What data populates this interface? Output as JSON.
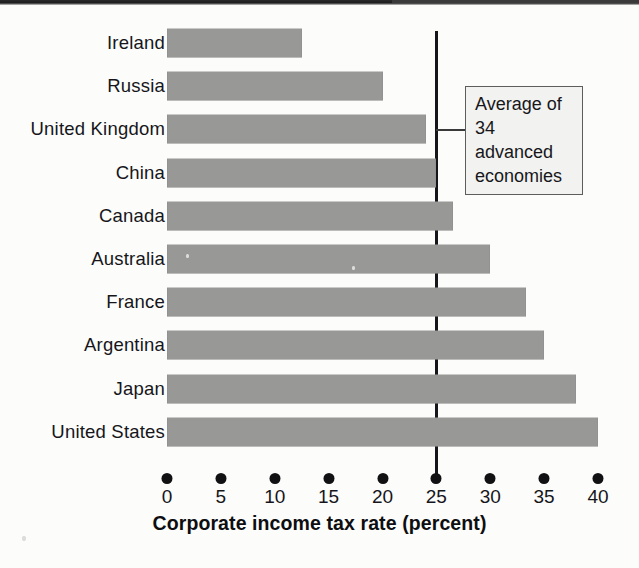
{
  "chart_data": {
    "type": "bar",
    "orientation": "horizontal",
    "title": "",
    "xlabel": "Corporate income tax rate (percent)",
    "ylabel": "",
    "categories": [
      "Ireland",
      "Russia",
      "United Kingdom",
      "China",
      "Canada",
      "Australia",
      "France",
      "Argentina",
      "Japan",
      "United States"
    ],
    "values": [
      12.5,
      20.0,
      24.0,
      25.0,
      26.5,
      30.0,
      33.3,
      35.0,
      38.0,
      40.0
    ],
    "xlim": [
      0,
      40
    ],
    "xticks": [
      0,
      5,
      10,
      15,
      20,
      25,
      30,
      35,
      40
    ],
    "xtick_labels": [
      "0",
      "5",
      "10",
      "15",
      "20",
      "25",
      "30",
      "35",
      "40"
    ],
    "grid": false,
    "legend": false,
    "bar_color": "#989897",
    "reference_line": {
      "value": 25,
      "color": "#16161a",
      "label": "Average of\n34 advanced\neconomies"
    },
    "annotations": [
      {
        "text": "Average of\n34 advanced\neconomies",
        "points_to": 25
      }
    ]
  },
  "axis": {
    "title": "Corporate income tax rate (percent)",
    "tick_labels": [
      "0",
      "5",
      "10",
      "15",
      "20",
      "25",
      "30",
      "35",
      "40"
    ]
  },
  "callout": {
    "text": "Average of\n34 advanced\neconomies"
  },
  "categories": [
    "Ireland",
    "Russia",
    "United Kingdom",
    "China",
    "Canada",
    "Australia",
    "France",
    "Argentina",
    "Japan",
    "United States"
  ]
}
